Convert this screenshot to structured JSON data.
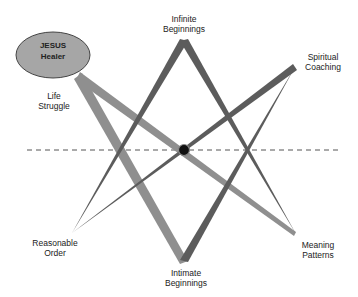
{
  "diagram": {
    "type": "unicursal-hexagram",
    "center_node": {
      "line1": "JESUS",
      "line2": "Healer",
      "fill": "#a6a6a6",
      "stroke": "#444444"
    },
    "labels": {
      "top": {
        "line1": "Infinite",
        "line2": "Beginnings"
      },
      "top_right": {
        "line1": "Spiritual",
        "line2": "Coaching"
      },
      "left": {
        "line1": "Life",
        "line2": "Struggle"
      },
      "bottom_left": {
        "line1": "Reasonable",
        "line2": "Order"
      },
      "bottom": {
        "line1": "Intimate",
        "line2": "Beginnings"
      },
      "bottom_right": {
        "line1": "Meaning",
        "line2": "Patterns"
      }
    },
    "colors": {
      "dark_line": "#5c5c5c",
      "light_line": "#8f8f8f",
      "axis": "#555555",
      "center_dot": "#111111"
    },
    "vertices": {
      "node": [
        78,
        76
      ],
      "top": [
        184,
        40
      ],
      "top_right": [
        295,
        67
      ],
      "bottom_left": [
        72,
        233
      ],
      "bottom": [
        184,
        262
      ],
      "bottom_right": [
        295,
        234
      ],
      "center": [
        184,
        150
      ]
    }
  }
}
